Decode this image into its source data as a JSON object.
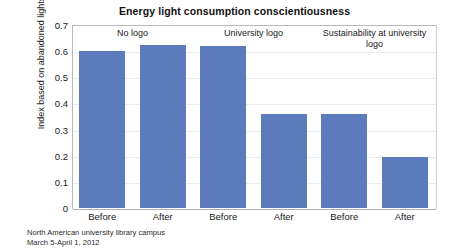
{
  "chart_data": {
    "type": "bar",
    "title": "Energy light consumption conscientiousness",
    "xlabel": "",
    "ylabel": "Index based on abandoned lights/ used lights",
    "ylim": [
      0,
      0.7
    ],
    "ytick_labels": [
      "0.7",
      "0.6",
      "0.5",
      "0.4",
      "0.3",
      "0.2",
      "0.1",
      "0"
    ],
    "ytick_values": [
      0.7,
      0.6,
      0.5,
      0.4,
      0.3,
      0.2,
      0.1,
      0
    ],
    "grid": true,
    "legend": "none",
    "categories": [
      "Before",
      "After",
      "Before",
      "After",
      "Before",
      "After"
    ],
    "values": [
      0.6,
      0.625,
      0.62,
      0.36,
      0.36,
      0.195
    ],
    "groups": [
      {
        "label": "No logo",
        "start_index": 0,
        "span": 2
      },
      {
        "label": "University logo",
        "start_index": 2,
        "span": 2
      },
      {
        "label": "Sustainability at university logo",
        "start_index": 4,
        "span": 2
      }
    ],
    "series": [
      {
        "name": "Index based on abandoned lights/ used lights",
        "values": [
          0.6,
          0.625,
          0.62,
          0.36,
          0.36,
          0.195
        ],
        "color": "#5b7bbd"
      }
    ],
    "annotations": {
      "footnote_line1": "North American university library campus",
      "footnote_line2": "March 5-April 1, 2012"
    }
  },
  "colors": {
    "bar": "#5b7bbd",
    "grid": "#e8ecf4",
    "axis": "#b0b0b0",
    "text": "#1a1a1a",
    "background": "#ffffff"
  }
}
